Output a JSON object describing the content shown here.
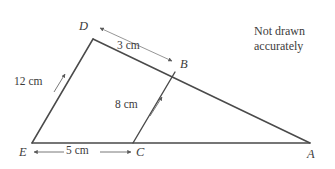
{
  "figure": {
    "type": "geometry-diagram",
    "note": {
      "line1": "Not drawn",
      "line2": "accurately"
    },
    "vertices": [
      {
        "id": "D",
        "label": "D",
        "x": 93,
        "y": 39
      },
      {
        "id": "B",
        "label": "B",
        "x": 175,
        "y": 72
      },
      {
        "id": "E",
        "label": "E",
        "x": 32,
        "y": 143
      },
      {
        "id": "C",
        "label": "C",
        "x": 133,
        "y": 143
      },
      {
        "id": "A",
        "label": "A",
        "x": 310,
        "y": 143
      }
    ],
    "segments": [
      {
        "id": "DA",
        "from": "D",
        "to": "A",
        "style": "solid"
      },
      {
        "id": "ED",
        "from": "E",
        "to": "D",
        "style": "solid"
      },
      {
        "id": "EA",
        "from": "E",
        "to": "A",
        "style": "solid"
      },
      {
        "id": "CB",
        "from": "C",
        "to": "B",
        "style": "solid"
      }
    ],
    "measurements": [
      {
        "id": "DB",
        "label": "3 cm",
        "value": 3,
        "unit": "cm",
        "between": [
          "D",
          "B"
        ],
        "arrow": "double"
      },
      {
        "id": "ED",
        "label": "12 cm",
        "value": 12,
        "unit": "cm",
        "between": [
          "E",
          "D"
        ],
        "arrow": "single"
      },
      {
        "id": "CB",
        "label": "8 cm",
        "value": 8,
        "unit": "cm",
        "between": [
          "C",
          "B"
        ],
        "arrow": "single"
      },
      {
        "id": "EC",
        "label": "5 cm",
        "value": 5,
        "unit": "cm",
        "between": [
          "E",
          "C"
        ],
        "arrow": "double"
      }
    ],
    "colors": {
      "stroke": "#4a4a4a",
      "annotation": "#6e6e6e",
      "text": "#3c3c3c",
      "background": "#ffffff"
    }
  }
}
